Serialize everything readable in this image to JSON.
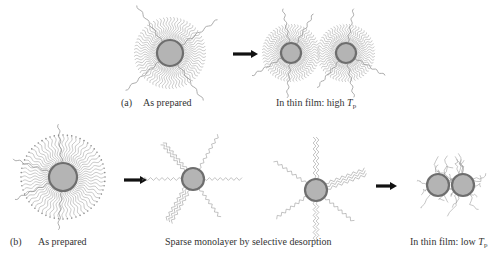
{
  "figure": {
    "panel_a": {
      "marker": "(a)",
      "stages": [
        {
          "id": "as-prepared",
          "caption": "As prepared"
        },
        {
          "id": "thin-film-high",
          "caption_prefix": "In thin film: high ",
          "caption_symbol": "T",
          "caption_subscript": "p"
        }
      ]
    },
    "panel_b": {
      "marker": "(b)",
      "stages": [
        {
          "id": "as-prepared",
          "caption": "As prepared"
        },
        {
          "id": "sparse-monolayer",
          "caption": "Sparse monolayer by selective desorption"
        },
        {
          "id": "thin-film-low",
          "caption_prefix": "In thin film: low ",
          "caption_symbol": "T",
          "caption_subscript": "p"
        }
      ]
    },
    "colors": {
      "core_fill": "#b4b4b4",
      "core_shell": "#6e6e6e",
      "ligand": "#9a9a9a",
      "arrow": "#111111",
      "text": "#333333"
    }
  }
}
